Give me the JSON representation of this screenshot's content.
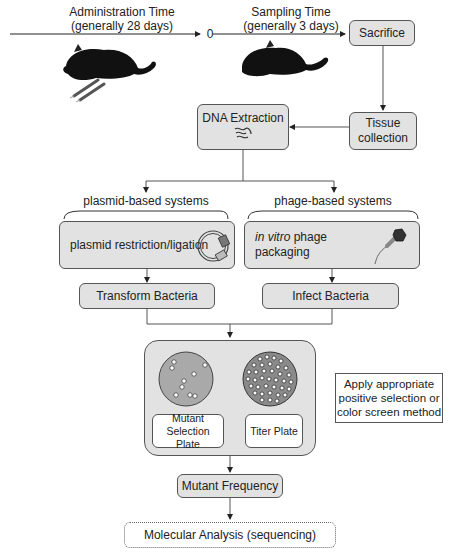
{
  "timeline": {
    "administration": {
      "title": "Administration Time",
      "detail": "(generally 28 days)"
    },
    "zero_marker": "0",
    "sampling": {
      "title": "Sampling Time",
      "detail": "(generally 3 days)"
    }
  },
  "nodes": {
    "sacrifice": "Sacrifice",
    "tissue_collection_line1": "Tissue",
    "tissue_collection_line2": "collection",
    "dna_extraction": "DNA Extraction",
    "plasmid_branch_label": "plasmid-based systems",
    "phage_branch_label": "phage-based systems",
    "plasmid_step": "plasmid restriction/ligation",
    "phage_step_italic": "in vitro",
    "phage_step_rest": " phage",
    "phage_step_line2": "packaging",
    "transform_bacteria": "Transform Bacteria",
    "infect_bacteria": "Infect Bacteria",
    "mutant_plate_line1": "Mutant",
    "mutant_plate_line2": "Selection Plate",
    "titer_plate": "Titer Plate",
    "side_note_line1": "Apply appropriate",
    "side_note_line2": "positive selection or",
    "side_note_line3": "color screen method",
    "mutant_frequency": "Mutant Frequency",
    "molecular_analysis": "Molecular Analysis (sequencing)"
  },
  "icons": [
    "mouse-with-syringe-icon",
    "mouse-icon",
    "dna-icon",
    "plasmid-icon",
    "phage-icon",
    "petri-dish-icon"
  ],
  "colors": {
    "box_fill": "#e2e2e2",
    "stroke": "#555555",
    "plate_fill": "#a9a9a9",
    "titer_fill": "#888888"
  }
}
